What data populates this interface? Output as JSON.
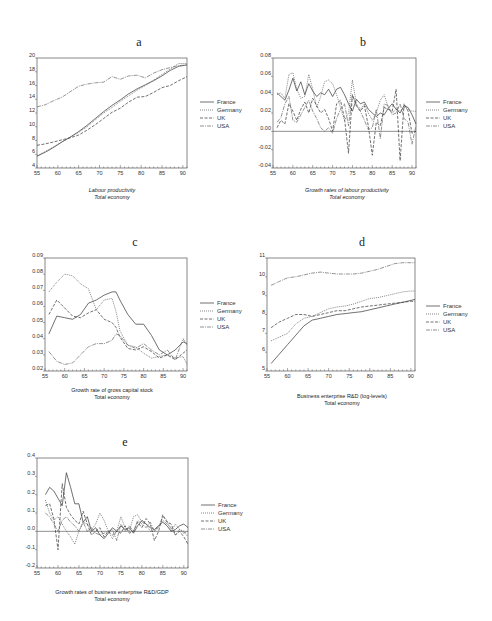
{
  "figure": {
    "legend_labels": [
      "France",
      "Germany",
      "UK",
      "USA"
    ]
  },
  "chart_data": [
    {
      "panel": "a",
      "type": "line",
      "title": "a",
      "caption": [
        "Labour productivity",
        "Total economy"
      ],
      "caption_italic": true,
      "xlabel": "",
      "ylabel": "",
      "xlim": [
        55,
        91
      ],
      "ylim": [
        4,
        20
      ],
      "xticks": [
        55,
        60,
        65,
        70,
        75,
        80,
        85,
        90
      ],
      "yticks": [
        4,
        6,
        8,
        10,
        12,
        14,
        16,
        18,
        20
      ],
      "zero_line": false,
      "legend": [
        "France",
        "Germany",
        "UK",
        "USA"
      ],
      "x": [
        55,
        57,
        59,
        61,
        63,
        65,
        67,
        69,
        71,
        73,
        75,
        77,
        79,
        81,
        83,
        85,
        87,
        89,
        91
      ],
      "series": [
        {
          "name": "France",
          "values": [
            5.7,
            6.3,
            7.0,
            7.8,
            8.5,
            9.3,
            10.2,
            11.2,
            12.2,
            13.1,
            13.9,
            14.8,
            15.5,
            16.1,
            16.7,
            17.4,
            18.2,
            18.8,
            19.0
          ]
        },
        {
          "name": "Germany",
          "values": [
            5.8,
            6.4,
            7.1,
            7.8,
            8.5,
            9.2,
            10.0,
            11.0,
            12.0,
            12.8,
            13.7,
            14.5,
            15.3,
            16.0,
            16.8,
            17.6,
            18.4,
            19.2,
            19.2
          ]
        },
        {
          "name": "UK",
          "values": [
            7.3,
            7.5,
            7.8,
            8.1,
            8.4,
            8.8,
            9.5,
            10.3,
            11.2,
            12.1,
            12.7,
            13.6,
            14.3,
            14.4,
            15.0,
            15.7,
            16.0,
            16.7,
            17.3
          ]
        },
        {
          "name": "USA",
          "values": [
            12.9,
            13.2,
            13.8,
            14.3,
            15.1,
            15.9,
            16.2,
            16.4,
            16.5,
            17.3,
            16.9,
            17.4,
            17.5,
            17.1,
            17.8,
            18.3,
            18.6,
            18.9,
            19.0
          ]
        }
      ]
    },
    {
      "panel": "b",
      "type": "line",
      "title": "b",
      "caption": [
        "Growth rates of labour productivity",
        "Total economy"
      ],
      "caption_italic": true,
      "xlabel": "",
      "ylabel": "",
      "xlim": [
        55,
        91
      ],
      "ylim": [
        -0.04,
        0.08
      ],
      "xticks": [
        55,
        60,
        65,
        70,
        75,
        80,
        85,
        90
      ],
      "yticks": [
        -0.04,
        -0.02,
        0.0,
        0.02,
        0.04,
        0.06,
        0.08
      ],
      "ytick_labels": [
        "-0.04",
        "-0.02",
        "0.00",
        "0.02",
        "0.04",
        "0.06",
        "0.08"
      ],
      "zero_line": true,
      "legend": [
        "France",
        "Germany",
        "UK",
        "USA"
      ],
      "x": [
        56,
        57,
        58,
        59,
        60,
        61,
        62,
        63,
        64,
        65,
        66,
        67,
        68,
        69,
        70,
        71,
        72,
        73,
        74,
        75,
        76,
        77,
        78,
        79,
        80,
        81,
        82,
        83,
        84,
        85,
        86,
        87,
        88,
        89,
        90,
        91
      ],
      "series": [
        {
          "name": "France",
          "values": [
            0.042,
            0.038,
            0.034,
            0.045,
            0.058,
            0.044,
            0.054,
            0.04,
            0.052,
            0.044,
            0.038,
            0.042,
            0.04,
            0.046,
            0.038,
            0.046,
            0.048,
            0.04,
            0.03,
            0.022,
            0.035,
            0.03,
            0.032,
            0.024,
            0.02,
            0.016,
            0.02,
            0.018,
            0.025,
            0.03,
            0.024,
            0.02,
            0.028,
            0.026,
            0.018,
            0.008
          ]
        },
        {
          "name": "Germany",
          "values": [
            0.04,
            0.042,
            0.036,
            0.062,
            0.064,
            0.046,
            0.036,
            0.038,
            0.062,
            0.046,
            0.026,
            0.038,
            0.054,
            0.056,
            0.052,
            0.04,
            0.026,
            0.012,
            0.02,
            0.056,
            0.03,
            0.024,
            0.03,
            0.02,
            0.012,
            0.02,
            0.034,
            0.04,
            0.026,
            0.02,
            0.024,
            0.022,
            0.026,
            0.024,
            0.022,
            0.022
          ]
        },
        {
          "name": "UK",
          "values": [
            0.004,
            0.012,
            0.008,
            0.03,
            0.022,
            0.012,
            0.024,
            0.032,
            0.02,
            0.036,
            0.028,
            0.02,
            0.024,
            0.014,
            0.0,
            0.03,
            0.034,
            0.014,
            -0.024,
            0.04,
            0.028,
            0.022,
            0.028,
            0.006,
            -0.026,
            0.01,
            0.006,
            0.026,
            0.024,
            0.022,
            0.046,
            -0.032,
            0.03,
            0.022,
            -0.002,
            0.0
          ]
        },
        {
          "name": "USA",
          "values": [
            0.01,
            0.015,
            0.03,
            0.038,
            0.012,
            0.01,
            0.018,
            0.026,
            0.034,
            0.022,
            0.014,
            0.004,
            0.0,
            0.004,
            -0.002,
            0.014,
            0.024,
            0.03,
            0.006,
            0.04,
            0.028,
            0.022,
            0.012,
            0.002,
            0.004,
            0.024,
            -0.008,
            0.03,
            0.028,
            0.018,
            0.02,
            0.03,
            0.014,
            0.01,
            -0.014,
            0.006
          ]
        }
      ]
    },
    {
      "panel": "c",
      "type": "line",
      "title": "c",
      "caption": [
        "Growth rate of gross capital stock",
        "Total economy"
      ],
      "caption_italic": false,
      "xlabel": "",
      "ylabel": "",
      "xlim": [
        55,
        91
      ],
      "ylim": [
        0.02,
        0.09
      ],
      "xticks": [
        55,
        60,
        65,
        70,
        75,
        80,
        85,
        90
      ],
      "yticks": [
        0.02,
        0.03,
        0.04,
        0.05,
        0.06,
        0.07,
        0.08,
        0.09
      ],
      "ytick_labels": [
        "0.02",
        "0.03",
        "0.04",
        "0.05",
        "0.06",
        "0.07",
        "0.08",
        "0.09"
      ],
      "zero_line": false,
      "legend": [
        "France",
        "Germany",
        "UK",
        "USA"
      ],
      "x": [
        56,
        58,
        60,
        62,
        64,
        66,
        68,
        70,
        72,
        73,
        74,
        76,
        78,
        80,
        82,
        84,
        86,
        88,
        90,
        91
      ],
      "series": [
        {
          "name": "France",
          "values": [
            0.043,
            0.054,
            0.053,
            0.052,
            0.055,
            0.062,
            0.064,
            0.067,
            0.069,
            0.069,
            0.064,
            0.055,
            0.049,
            0.049,
            0.042,
            0.033,
            0.03,
            0.033,
            0.038,
            0.037
          ]
        },
        {
          "name": "Germany",
          "values": [
            0.069,
            0.075,
            0.08,
            0.079,
            0.074,
            0.071,
            0.058,
            0.064,
            0.065,
            0.057,
            0.045,
            0.036,
            0.035,
            0.031,
            0.028,
            0.029,
            0.03,
            0.028,
            0.029,
            0.024
          ]
        },
        {
          "name": "UK",
          "values": [
            0.055,
            0.064,
            0.059,
            0.054,
            0.053,
            0.056,
            0.058,
            0.052,
            0.05,
            0.047,
            0.041,
            0.034,
            0.033,
            0.035,
            0.032,
            0.028,
            0.03,
            0.027,
            0.031,
            0.033
          ]
        },
        {
          "name": "USA",
          "values": [
            0.032,
            0.026,
            0.024,
            0.025,
            0.03,
            0.035,
            0.037,
            0.037,
            0.039,
            0.043,
            0.042,
            0.036,
            0.034,
            0.037,
            0.033,
            0.03,
            0.033,
            0.027,
            0.04,
            0.036
          ]
        }
      ]
    },
    {
      "panel": "d",
      "type": "line",
      "title": "d",
      "caption": [
        "Business enterprise R&D (log-levels)",
        "Total economy"
      ],
      "caption_italic": false,
      "xlabel": "",
      "ylabel": "",
      "xlim": [
        55,
        91
      ],
      "ylim": [
        5,
        11
      ],
      "xticks": [
        55,
        60,
        65,
        70,
        75,
        80,
        85,
        90
      ],
      "yticks": [
        5,
        6,
        7,
        8,
        9,
        10,
        11
      ],
      "zero_line": false,
      "legend": [
        "France",
        "Germany",
        "UK",
        "USA"
      ],
      "x": [
        56,
        58,
        60,
        62,
        64,
        66,
        68,
        70,
        72,
        74,
        76,
        78,
        80,
        82,
        84,
        86,
        88,
        90,
        91
      ],
      "series": [
        {
          "name": "France",
          "values": [
            5.4,
            5.9,
            6.4,
            6.9,
            7.4,
            7.7,
            7.8,
            7.9,
            8.0,
            8.05,
            8.1,
            8.15,
            8.25,
            8.35,
            8.45,
            8.55,
            8.65,
            8.75,
            8.8
          ]
        },
        {
          "name": "Germany",
          "values": [
            6.6,
            6.8,
            7.0,
            7.5,
            7.8,
            7.9,
            8.1,
            8.3,
            8.4,
            8.45,
            8.55,
            8.7,
            8.85,
            8.9,
            9.0,
            9.1,
            9.2,
            9.25,
            9.25
          ]
        },
        {
          "name": "UK",
          "values": [
            7.3,
            7.6,
            7.8,
            8.0,
            8.0,
            7.9,
            8.0,
            8.1,
            8.2,
            8.2,
            8.3,
            8.4,
            8.45,
            8.5,
            8.55,
            8.6,
            8.65,
            8.7,
            8.7
          ]
        },
        {
          "name": "USA",
          "values": [
            9.55,
            9.75,
            9.95,
            10.0,
            10.1,
            10.2,
            10.25,
            10.2,
            10.15,
            10.15,
            10.15,
            10.2,
            10.3,
            10.4,
            10.55,
            10.7,
            10.75,
            10.75,
            10.75
          ]
        }
      ]
    },
    {
      "panel": "e",
      "type": "line",
      "title": "e",
      "caption": [
        "Growth rates of business enterprise R&D/GDP",
        "Total economy"
      ],
      "caption_italic": false,
      "xlabel": "",
      "ylabel": "",
      "xlim": [
        55,
        91
      ],
      "ylim": [
        -0.2,
        0.4
      ],
      "xticks": [
        55,
        60,
        65,
        70,
        75,
        80,
        85,
        90
      ],
      "yticks": [
        -0.2,
        -0.1,
        0.0,
        0.1,
        0.2,
        0.3,
        0.4
      ],
      "ytick_labels": [
        "-0.2",
        "-0.1",
        "0.0",
        "0.1",
        "0.2",
        "0.3",
        "0.4"
      ],
      "zero_line": true,
      "legend": [
        "France",
        "Germany",
        "UK",
        "USA"
      ],
      "x": [
        57,
        58,
        59,
        60,
        61,
        62,
        63,
        64,
        65,
        66,
        67,
        68,
        69,
        70,
        71,
        72,
        73,
        74,
        75,
        76,
        77,
        78,
        79,
        80,
        81,
        82,
        83,
        84,
        85,
        86,
        87,
        88,
        89,
        90,
        91
      ],
      "series": [
        {
          "name": "France",
          "values": [
            0.2,
            0.24,
            0.22,
            0.18,
            0.14,
            0.32,
            0.24,
            0.15,
            0.15,
            0.05,
            0.08,
            0.0,
            0.02,
            -0.02,
            -0.04,
            -0.01,
            0.02,
            0.0,
            0.03,
            0.01,
            0.02,
            -0.01,
            0.03,
            0.06,
            0.04,
            0.02,
            0.01,
            0.03,
            0.05,
            0.03,
            0.0,
            0.01,
            0.03,
            0.04,
            0.02
          ]
        },
        {
          "name": "Germany",
          "values": [
            0.17,
            0.1,
            0.06,
            0.08,
            0.04,
            0.0,
            -0.03,
            -0.07,
            0.0,
            0.05,
            0.04,
            0.01,
            0.04,
            0.1,
            0.06,
            0.0,
            -0.04,
            0.0,
            0.08,
            0.02,
            0.0,
            0.08,
            0.09,
            0.05,
            0.04,
            0.0,
            0.0,
            0.02,
            0.08,
            0.06,
            0.0,
            0.04,
            0.01,
            0.0,
            -0.03
          ]
        },
        {
          "name": "UK",
          "values": [
            0.14,
            0.15,
            0.07,
            -0.1,
            0.26,
            0.13,
            0.09,
            0.06,
            0.04,
            0.11,
            0.04,
            -0.02,
            0.0,
            0.02,
            -0.03,
            0.0,
            -0.02,
            0.0,
            -0.01,
            0.03,
            -0.01,
            0.0,
            0.05,
            0.02,
            0.07,
            0.04,
            -0.05,
            0.0,
            0.09,
            0.05,
            0.04,
            -0.02,
            0.0,
            -0.03,
            -0.07
          ]
        },
        {
          "name": "USA",
          "values": [
            0.1,
            0.08,
            0.04,
            0.0,
            0.06,
            0.08,
            0.05,
            0.03,
            0.0,
            0.05,
            0.0,
            0.02,
            -0.01,
            -0.02,
            -0.01,
            0.0,
            0.01,
            -0.05,
            0.04,
            0.0,
            0.03,
            0.0,
            0.06,
            0.04,
            0.02,
            0.05,
            0.0,
            0.03,
            0.06,
            0.04,
            0.02,
            -0.02,
            0.01,
            -0.01,
            0.0
          ]
        }
      ]
    }
  ]
}
